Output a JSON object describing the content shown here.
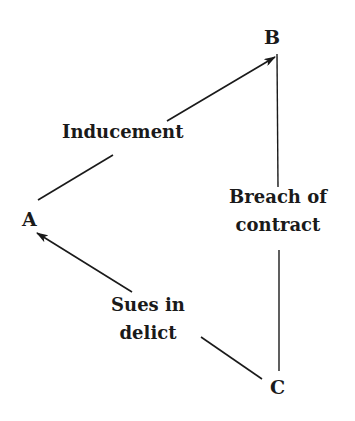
{
  "diagram": {
    "nodes": {
      "a": "A",
      "b": "B",
      "c": "C"
    },
    "edges": {
      "inducement": "Inducement",
      "breach_line1": "Breach of",
      "breach_line2": "contract",
      "sues_line1": "Sues in",
      "sues_line2": "delict"
    },
    "colors": {
      "ink": "#1a1a1a",
      "background": "#ffffff"
    }
  }
}
